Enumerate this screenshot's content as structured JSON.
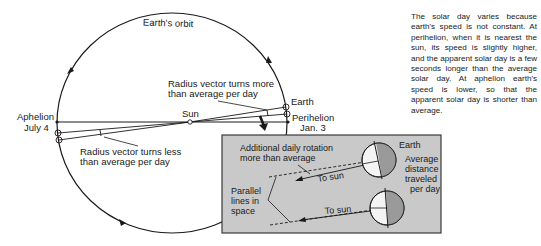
{
  "diagram": {
    "orbit_label": "Earth's orbit",
    "sun_label": "Sun",
    "earth_label": "Earth",
    "aphelion": {
      "name": "Aphelion",
      "date": "July 4"
    },
    "perihelion": {
      "name": "Perihelion",
      "date": "Jan. 3"
    },
    "radius_more": {
      "line1": "Radius vector turns more",
      "line2": "than average per day"
    },
    "radius_less": {
      "line1": "Radius vector turns less",
      "line2": "than average per day"
    }
  },
  "inset": {
    "additional": {
      "line1": "Additional daily rotation",
      "line2": "more than average"
    },
    "parallel": {
      "line1": "Parallel",
      "line2": "lines in",
      "line3": "space"
    },
    "to_sun_1": "To sun",
    "to_sun_2": "To sun",
    "earth_label": "Earth",
    "avg_distance": {
      "line1": "Average",
      "line2": "distance",
      "line3": "traveled",
      "line4": "per day"
    },
    "colors": {
      "box_fill": "#c9c9c9",
      "earth_shadow": "#9a9a9a",
      "earth_lit": "#f4f4f4"
    }
  },
  "caption": "The solar day varies because earth's speed is not constant. At perihelion, when it is nearest the sun, its speed is slightly higher, and the apparent solar day is a few seconds longer than the average solar day. At aphelion earth's speed is lower, so that the apparent solar day is shorter than average."
}
